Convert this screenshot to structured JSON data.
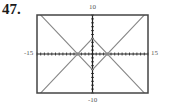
{
  "problem_number": "47.",
  "chart_data": {
    "type": "line",
    "title": "",
    "xlabel": "",
    "ylabel": "",
    "xlim": [
      -15,
      15
    ],
    "ylim": [
      -10,
      10
    ],
    "x_tick_labels": {
      "min": "-15",
      "max": "15"
    },
    "y_tick_labels": {
      "min": "-10",
      "max": "10"
    },
    "grid": false,
    "tick_marks": "unit ticks along both axes",
    "note": "Intercepts and apexes are estimated from pixel positions (~±4); exact functions are not labeled.",
    "series": [
      {
        "name": "y = |x| - 4 (approx.)",
        "x": [
          -15,
          0,
          15
        ],
        "y": [
          11,
          -4,
          11
        ]
      },
      {
        "name": "y = 4 - |x| (approx.)",
        "x": [
          -15,
          0,
          15
        ],
        "y": [
          -11,
          4,
          -11
        ]
      }
    ],
    "key_points_approx": {
      "x_intercepts": [
        -4,
        4
      ],
      "top_apex": [
        0,
        4
      ],
      "bottom_apex": [
        0,
        -4
      ]
    },
    "colors": {
      "frame": "#444444",
      "axes": "#222222",
      "curves": "#888888"
    }
  }
}
